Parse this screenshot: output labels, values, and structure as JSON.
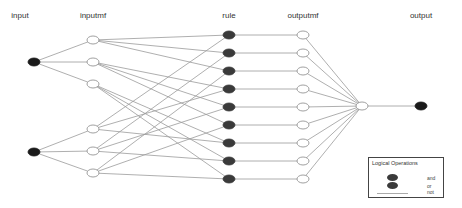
{
  "diagram": {
    "columns": [
      {
        "id": "input",
        "label": "input",
        "x": 20
      },
      {
        "id": "inputmf",
        "label": "inputmf",
        "x": 93
      },
      {
        "id": "rule",
        "label": "rule",
        "x": 229
      },
      {
        "id": "outputmf",
        "label": "outputmf",
        "x": 303
      },
      {
        "id": "output",
        "label": "output",
        "x": 421
      }
    ],
    "nodes": {
      "input": [
        {
          "x": 34,
          "y": 62
        },
        {
          "x": 34,
          "y": 152
        }
      ],
      "inputmf": [
        {
          "x": 93,
          "y": 40
        },
        {
          "x": 93,
          "y": 62
        },
        {
          "x": 93,
          "y": 84
        },
        {
          "x": 93,
          "y": 129
        },
        {
          "x": 93,
          "y": 151
        },
        {
          "x": 93,
          "y": 173
        }
      ],
      "rule": [
        {
          "x": 229,
          "y": 35
        },
        {
          "x": 229,
          "y": 53
        },
        {
          "x": 229,
          "y": 71
        },
        {
          "x": 229,
          "y": 89
        },
        {
          "x": 229,
          "y": 107
        },
        {
          "x": 229,
          "y": 125
        },
        {
          "x": 229,
          "y": 143
        },
        {
          "x": 229,
          "y": 161
        },
        {
          "x": 229,
          "y": 179
        }
      ],
      "outputmf": [
        {
          "x": 303,
          "y": 35
        },
        {
          "x": 303,
          "y": 53
        },
        {
          "x": 303,
          "y": 71
        },
        {
          "x": 303,
          "y": 89
        },
        {
          "x": 303,
          "y": 107
        },
        {
          "x": 303,
          "y": 125
        },
        {
          "x": 303,
          "y": 143
        },
        {
          "x": 303,
          "y": 161
        },
        {
          "x": 303,
          "y": 179
        }
      ],
      "aggregate": {
        "x": 362,
        "y": 106
      },
      "output": {
        "x": 421,
        "y": 106
      }
    },
    "rule_map": [
      [
        0,
        3
      ],
      [
        0,
        4
      ],
      [
        0,
        5
      ],
      [
        1,
        3
      ],
      [
        1,
        4
      ],
      [
        1,
        5
      ],
      [
        2,
        3
      ],
      [
        2,
        4
      ],
      [
        2,
        5
      ]
    ],
    "colors": {
      "filled_node": "#3a3a3a",
      "input_node": "#1a1a1a",
      "hollow_stroke": "#888888",
      "edge": "#9a9a9a"
    }
  },
  "legend": {
    "title": "Logical Operations",
    "items": [
      {
        "label": "and",
        "symbol": "filled-circle"
      },
      {
        "label": "or",
        "symbol": "filled-circle"
      },
      {
        "label": "not",
        "symbol": "line"
      }
    ]
  }
}
